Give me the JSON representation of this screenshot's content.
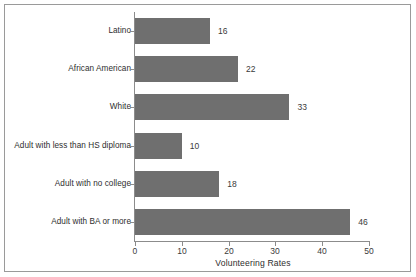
{
  "chart_data": {
    "type": "bar",
    "orientation": "horizontal",
    "title": "",
    "subtitle": "",
    "xlabel": "Volunteering Rates",
    "ylabel": "",
    "categories": [
      "Latino",
      "African American",
      "White",
      "Adult with less than HS diploma",
      "Adult with no college",
      "Adult with BA or more"
    ],
    "values": [
      16,
      22,
      33,
      10,
      18,
      46
    ],
    "data_labels": [
      "16",
      "22",
      "33",
      "10",
      "18",
      "46"
    ],
    "xlim": [
      0,
      50
    ],
    "xticks": [
      0,
      10,
      20,
      30,
      40,
      50
    ],
    "xtick_labels": [
      "0",
      "10",
      "20",
      "30",
      "40",
      "50"
    ],
    "grid": false,
    "legend": null,
    "legend_position": "none",
    "annotations": [],
    "colors": {
      "bar_fill": "#6f6f6f",
      "axis_line": "#8c8c8c",
      "text": "#2e2e2e",
      "tick_text": "#3a3a3a",
      "background": "#ffffff",
      "frame_border": "#9a9a9a"
    }
  },
  "figure": {
    "frame_visible": true,
    "background": "#ffffff"
  }
}
